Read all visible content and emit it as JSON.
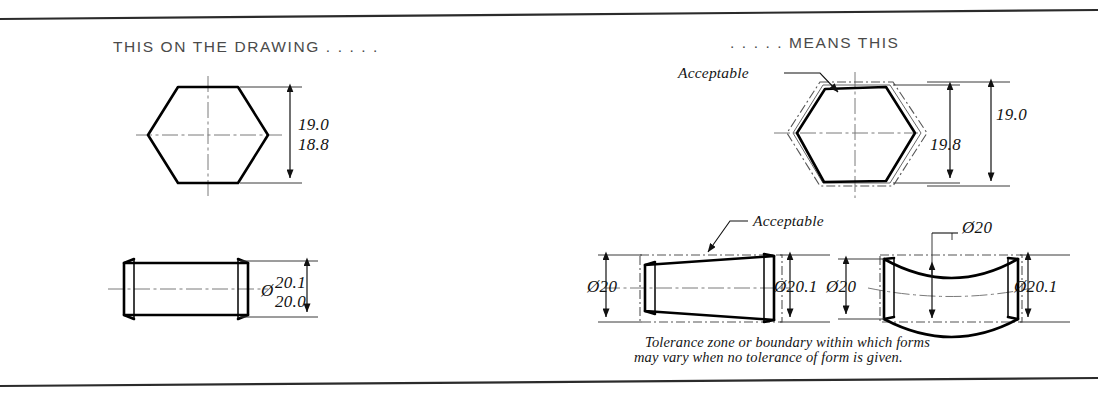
{
  "figure": {
    "title_left": "THIS ON THE DRAWING . . . . .",
    "title_right": ". . . . . MEANS THIS",
    "caption_line1": "Tolerance zone or boundary within which forms",
    "caption_line2": "may vary when no tolerance of form is given."
  },
  "left_panel": {
    "hexagon_dim_upper": "19.0",
    "hexagon_dim_lower": "18.8",
    "cylinder_dia_symbol": "Ø",
    "cylinder_dim_upper": "20.1",
    "cylinder_dim_lower": "20.0"
  },
  "right_panel": {
    "hexagon_note": "Acceptable",
    "hexagon_dim_outer": "19.0",
    "hexagon_dim_inner": "19.8",
    "taper_note": "Acceptable",
    "taper_dim_left": "Ø20",
    "taper_dim_right": "Ø20.1",
    "barrel_dim_top": "Ø20",
    "barrel_dim_left": "Ø20",
    "barrel_dim_right": "Ø20.1"
  },
  "colors": {
    "ink": "#111111",
    "thin_ink": "#555555",
    "header_ink": "#4a4a4a",
    "paper": "#ffffff"
  }
}
